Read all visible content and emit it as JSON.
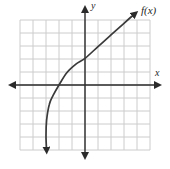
{
  "figure": {
    "labels": {
      "y_axis": "y",
      "x_axis": "x",
      "function": "f(x)"
    },
    "colors": {
      "background": "#ffffff",
      "grid": "#cccccc",
      "axis": "#2b2b2b",
      "curve": "#3a3a3a"
    }
  },
  "chart_data": {
    "type": "line",
    "title": "",
    "xlabel": "x",
    "ylabel": "y",
    "xlim": [
      -5,
      5
    ],
    "ylim": [
      -5,
      5
    ],
    "grid": true,
    "legend": false,
    "series": [
      {
        "name": "f(x)",
        "points": [
          [
            -2.95,
            -5.05
          ],
          [
            -3.0,
            -3.9
          ],
          [
            -2.95,
            -2.7
          ],
          [
            -2.75,
            -1.5
          ],
          [
            -2.45,
            -0.8
          ],
          [
            -2,
            0
          ],
          [
            -1.4,
            0.95
          ],
          [
            -0.7,
            1.6
          ],
          [
            0,
            2.05
          ],
          [
            1,
            2.95
          ],
          [
            2,
            3.85
          ],
          [
            3,
            4.75
          ],
          [
            3.85,
            5.5
          ]
        ],
        "arrows": "both",
        "x_intercept": [
          -2,
          0
        ],
        "y_intercept": [
          0,
          2
        ]
      }
    ]
  }
}
